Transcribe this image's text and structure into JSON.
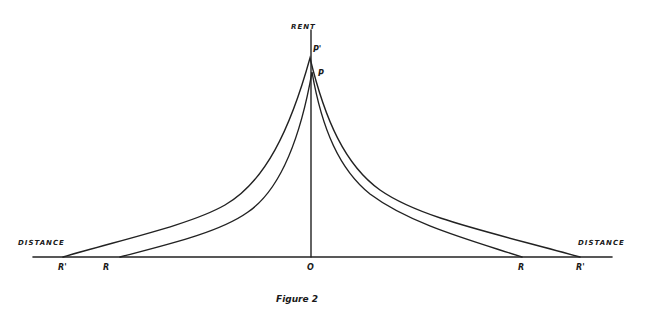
{
  "diagram": {
    "title": "Figure 2",
    "y_axis_label": "RENT",
    "x_axis_left_label": "DISTANCE",
    "x_axis_right_label": "DISTANCE",
    "origin_label": "O",
    "peak_labels": {
      "outer": "P'",
      "inner": "P"
    },
    "endpoint_labels": {
      "left_outer": "R'",
      "left_inner": "R",
      "right_inner": "R",
      "right_outer": "R'"
    },
    "curves": [
      {
        "name": "outer-rent-curve",
        "peak": "P'",
        "ends": [
          "R'",
          "R'"
        ]
      },
      {
        "name": "inner-rent-curve",
        "peak": "P",
        "ends": [
          "R",
          "R"
        ]
      }
    ],
    "ink_color": "#222222",
    "paper_color": "#ffffff"
  }
}
